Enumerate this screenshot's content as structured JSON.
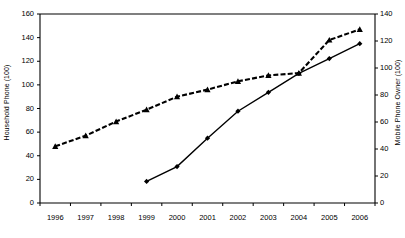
{
  "chart_data": {
    "type": "line",
    "title": "",
    "xlabel": "",
    "categories": [
      "1996",
      "1997",
      "1998",
      "1999",
      "2000",
      "2001",
      "2002",
      "2003",
      "2004",
      "2005",
      "2006"
    ],
    "grid": false,
    "legend": "none",
    "axes": {
      "left": {
        "label": "Household Phone (100)",
        "ticks": [
          0,
          20,
          40,
          60,
          80,
          100,
          120,
          140,
          160
        ],
        "lim": [
          0,
          160
        ]
      },
      "right": {
        "label": "Mobile Phone Owner (100)",
        "ticks": [
          0,
          20,
          40,
          60,
          80,
          100,
          120,
          140
        ],
        "lim": [
          0,
          140
        ]
      }
    },
    "series": [
      {
        "name": "Household Phone (100)",
        "axis": "left",
        "style": "dashed",
        "marker": "triangle",
        "values": [
          48,
          57,
          69,
          79,
          90,
          96,
          103,
          108,
          110,
          138,
          147
        ]
      },
      {
        "name": "Mobile Phone Owner (100)",
        "axis": "right",
        "style": "solid",
        "marker": "diamond",
        "values": [
          null,
          null,
          null,
          16,
          27,
          48,
          68,
          82,
          96,
          107,
          118
        ]
      }
    ]
  },
  "axis_titles": {
    "left": "Household Phone (100)",
    "right": "Mobile Phone Owner (100)"
  }
}
